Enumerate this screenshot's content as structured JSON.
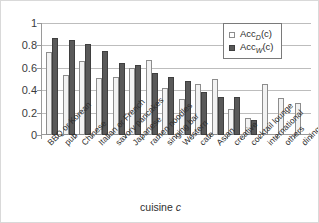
{
  "chart_data": {
    "type": "bar",
    "title": "",
    "xlabel": "cuisine c",
    "ylabel": "",
    "ylim": [
      0,
      1
    ],
    "yticks": [
      "0",
      "0.2",
      "0.4",
      "0.6",
      "0.8",
      "1"
    ],
    "grid": true,
    "legend_position": "top-right",
    "categories": [
      "BBQ or Korean",
      "pub",
      "Chinese",
      "Italian or French",
      "savory pancakes",
      "Japanese",
      "ramen noodles",
      "singing bar",
      "Western",
      "cafe",
      "Asian",
      "creative",
      "cocktail lounge",
      "international",
      "others",
      "dining bar"
    ],
    "series": [
      {
        "name": "AccD(c)",
        "name_base": "Acc",
        "name_sub": "D",
        "name_suffix": "(c)",
        "color": "#f2f2f2",
        "values": [
          0.74,
          0.54,
          0.665,
          0.505,
          0.515,
          0.6,
          0.67,
          0.42,
          0.32,
          0.455,
          0.5,
          0.235,
          0.155,
          0.455,
          0.33,
          0.29
        ]
      },
      {
        "name": "AccW(c)",
        "name_base": "Acc",
        "name_sub": "W",
        "name_suffix": "(c)",
        "color": "#595959",
        "values": [
          0.87,
          0.85,
          0.815,
          0.75,
          0.64,
          0.625,
          0.55,
          0.515,
          0.48,
          0.385,
          0.335,
          0.335,
          0.135,
          null,
          null,
          null
        ]
      }
    ]
  },
  "axis": {
    "x_title_text": "cuisine ",
    "x_title_italic": "c"
  },
  "legend": {
    "rows": [
      {
        "base": "Acc",
        "sub": "D",
        "suffix": "(c)"
      },
      {
        "base": "Acc",
        "sub": "W",
        "suffix": "(c)"
      }
    ]
  }
}
